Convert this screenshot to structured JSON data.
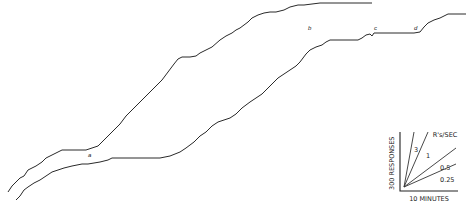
{
  "figure": {
    "type": "cumulative-record",
    "records": [
      {
        "name": "upper-record",
        "points": [
          [
            8,
            192
          ],
          [
            12,
            186
          ],
          [
            16,
            182
          ],
          [
            20,
            178
          ],
          [
            24,
            176
          ],
          [
            28,
            170
          ],
          [
            32,
            168
          ],
          [
            36,
            166
          ],
          [
            42,
            162
          ],
          [
            46,
            158
          ],
          [
            50,
            156
          ],
          [
            54,
            154
          ],
          [
            58,
            152
          ],
          [
            62,
            150
          ],
          [
            66,
            150
          ],
          [
            70,
            150
          ],
          [
            78,
            150
          ],
          [
            86,
            150
          ],
          [
            92,
            148
          ],
          [
            98,
            146
          ],
          [
            102,
            142
          ],
          [
            108,
            136
          ],
          [
            114,
            130
          ],
          [
            120,
            124
          ],
          [
            126,
            116
          ],
          [
            134,
            108
          ],
          [
            142,
            100
          ],
          [
            150,
            92
          ],
          [
            156,
            86
          ],
          [
            162,
            80
          ],
          [
            168,
            72
          ],
          [
            174,
            64
          ],
          [
            178,
            59
          ],
          [
            182,
            57
          ],
          [
            190,
            57
          ],
          [
            196,
            56
          ],
          [
            200,
            53
          ],
          [
            206,
            50
          ],
          [
            212,
            47
          ],
          [
            220,
            40
          ],
          [
            226,
            36
          ],
          [
            232,
            33
          ],
          [
            236,
            30
          ],
          [
            240,
            28
          ],
          [
            248,
            22
          ],
          [
            252,
            18
          ],
          [
            258,
            15
          ],
          [
            264,
            13
          ],
          [
            270,
            12
          ],
          [
            276,
            12
          ],
          [
            284,
            10
          ],
          [
            290,
            7
          ],
          [
            298,
            5
          ],
          [
            304,
            5
          ],
          [
            312,
            4
          ],
          [
            320,
            3
          ],
          [
            330,
            3
          ],
          [
            342,
            3
          ],
          [
            352,
            3
          ],
          [
            362,
            3
          ],
          [
            372,
            3
          ]
        ],
        "labels": [
          {
            "text": "a",
            "x": 88,
            "y": 157
          },
          {
            "text": "b",
            "x": 308,
            "y": 30
          }
        ]
      },
      {
        "name": "lower-record",
        "points": [
          [
            16,
            200
          ],
          [
            20,
            196
          ],
          [
            24,
            190
          ],
          [
            28,
            187
          ],
          [
            34,
            183
          ],
          [
            40,
            180
          ],
          [
            46,
            176
          ],
          [
            52,
            172
          ],
          [
            58,
            170
          ],
          [
            64,
            168
          ],
          [
            72,
            166
          ],
          [
            82,
            164
          ],
          [
            88,
            164
          ],
          [
            94,
            163
          ],
          [
            100,
            162
          ],
          [
            108,
            160
          ],
          [
            112,
            158
          ],
          [
            120,
            158
          ],
          [
            140,
            158
          ],
          [
            160,
            158
          ],
          [
            170,
            156
          ],
          [
            180,
            152
          ],
          [
            186,
            148
          ],
          [
            194,
            142
          ],
          [
            200,
            136
          ],
          [
            206,
            132
          ],
          [
            212,
            126
          ],
          [
            218,
            122
          ],
          [
            224,
            120
          ],
          [
            230,
            118
          ],
          [
            236,
            114
          ],
          [
            242,
            108
          ],
          [
            250,
            102
          ],
          [
            256,
            98
          ],
          [
            262,
            94
          ],
          [
            268,
            88
          ],
          [
            274,
            82
          ],
          [
            278,
            78
          ],
          [
            284,
            74
          ],
          [
            290,
            70
          ],
          [
            296,
            66
          ],
          [
            300,
            62
          ],
          [
            306,
            54
          ],
          [
            310,
            50
          ],
          [
            316,
            47
          ],
          [
            322,
            45
          ],
          [
            326,
            42
          ],
          [
            330,
            40
          ],
          [
            336,
            40
          ],
          [
            346,
            40
          ],
          [
            358,
            40
          ],
          [
            362,
            38
          ],
          [
            366,
            35
          ],
          [
            370,
            34
          ],
          [
            372,
            36
          ],
          [
            374,
            33
          ],
          [
            380,
            33
          ],
          [
            392,
            33
          ],
          [
            404,
            33
          ],
          [
            414,
            33
          ],
          [
            420,
            32
          ],
          [
            424,
            27
          ],
          [
            428,
            23
          ],
          [
            434,
            20
          ],
          [
            440,
            18
          ],
          [
            444,
            16
          ],
          [
            448,
            14
          ],
          [
            452,
            14
          ],
          [
            460,
            14
          ],
          [
            466,
            14
          ]
        ],
        "labels": [
          {
            "text": "c",
            "x": 374,
            "y": 30
          },
          {
            "text": "d",
            "x": 414,
            "y": 30
          }
        ]
      }
    ]
  },
  "key": {
    "y_label": "300 RESPONSES",
    "x_label": "10 MINUTES",
    "rate_title": "R's/SEC",
    "rates": [
      {
        "label": "3",
        "x2": 414,
        "y2": 132
      },
      {
        "label": "1",
        "x2": 428,
        "y2": 132
      },
      {
        "label": "0.5",
        "x2": 456,
        "y2": 148
      },
      {
        "label": "0.25",
        "x2": 456,
        "y2": 164
      }
    ]
  }
}
